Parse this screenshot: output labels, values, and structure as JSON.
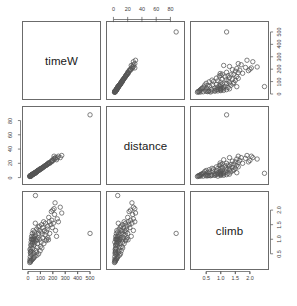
{
  "chart_data": {
    "type": "scatter",
    "title": "",
    "subtitle": "",
    "plot_kind": "scatterplot-matrix",
    "variables": [
      "timeW",
      "distance",
      "climb"
    ],
    "variable_labels": {
      "timeW": "timeW",
      "distance": "distance",
      "climb": "climb"
    },
    "axes": {
      "timeW": {
        "label": "timeW",
        "lim": [
          0,
          540
        ],
        "ticks": [
          0,
          100,
          200,
          300,
          400,
          500
        ],
        "tick_labels": [
          "0",
          "100",
          "200",
          "300",
          "400",
          "500"
        ]
      },
      "distance": {
        "label": "distance",
        "lim": [
          -2,
          92
        ],
        "ticks": [
          0,
          20,
          40,
          60,
          80
        ],
        "tick_labels": [
          "0",
          "20",
          "40",
          "60",
          "80"
        ]
      },
      "climb": {
        "label": "climb",
        "lim": [
          0.15,
          2.45
        ],
        "ticks": [
          0.5,
          1.0,
          1.5,
          2.0
        ],
        "tick_labels": [
          "0.5",
          "1.0",
          "1.5",
          "2.0"
        ]
      }
    },
    "grid": false,
    "legend": "none",
    "point_style": {
      "marker": "open-circle",
      "color": "#555555",
      "size": 2.2
    },
    "points": [
      {
        "timeW": 16.1,
        "distance": 2.5,
        "climb": 0.65
      },
      {
        "timeW": 60.0,
        "distance": 6.0,
        "climb": 2.5
      },
      {
        "timeW": 25.0,
        "distance": 2.0,
        "climb": 0.9
      },
      {
        "timeW": 22.0,
        "distance": 3.0,
        "climb": 0.8
      },
      {
        "timeW": 21.0,
        "distance": 3.0,
        "climb": 0.6
      },
      {
        "timeW": 29.0,
        "distance": 3.2,
        "climb": 1.1
      },
      {
        "timeW": 21.0,
        "distance": 2.4,
        "climb": 0.5
      },
      {
        "timeW": 18.0,
        "distance": 2.0,
        "climb": 0.4
      },
      {
        "timeW": 30.0,
        "distance": 4.0,
        "climb": 0.8
      },
      {
        "timeW": 27.0,
        "distance": 3.0,
        "climb": 1.0
      },
      {
        "timeW": 19.0,
        "distance": 2.5,
        "climb": 0.55
      },
      {
        "timeW": 32.0,
        "distance": 4.0,
        "climb": 1.0
      },
      {
        "timeW": 24.0,
        "distance": 3.0,
        "climb": 0.7
      },
      {
        "timeW": 36.0,
        "distance": 4.5,
        "climb": 1.0
      },
      {
        "timeW": 41.0,
        "distance": 5.0,
        "climb": 1.1
      },
      {
        "timeW": 34.0,
        "distance": 4.5,
        "climb": 0.85
      },
      {
        "timeW": 45.0,
        "distance": 5.5,
        "climb": 1.0
      },
      {
        "timeW": 38.0,
        "distance": 5.0,
        "climb": 0.9
      },
      {
        "timeW": 52.0,
        "distance": 6.0,
        "climb": 1.25
      },
      {
        "timeW": 49.0,
        "distance": 6.0,
        "climb": 1.05
      },
      {
        "timeW": 43.0,
        "distance": 5.5,
        "climb": 0.95
      },
      {
        "timeW": 55.0,
        "distance": 6.5,
        "climb": 1.1
      },
      {
        "timeW": 58.0,
        "distance": 7.0,
        "climb": 1.0
      },
      {
        "timeW": 62.0,
        "distance": 7.5,
        "climb": 1.15
      },
      {
        "timeW": 47.0,
        "distance": 6.0,
        "climb": 0.8
      },
      {
        "timeW": 66.0,
        "distance": 8.0,
        "climb": 0.95
      },
      {
        "timeW": 70.0,
        "distance": 8.0,
        "climb": 1.35
      },
      {
        "timeW": 74.0,
        "distance": 9.0,
        "climb": 1.0
      },
      {
        "timeW": 80.0,
        "distance": 10.0,
        "climb": 1.05
      },
      {
        "timeW": 85.0,
        "distance": 10.5,
        "climb": 1.2
      },
      {
        "timeW": 92.0,
        "distance": 11.0,
        "climb": 1.45
      },
      {
        "timeW": 78.0,
        "distance": 9.5,
        "climb": 0.85
      },
      {
        "timeW": 96.0,
        "distance": 12.0,
        "climb": 1.0
      },
      {
        "timeW": 104.0,
        "distance": 12.5,
        "climb": 1.25
      },
      {
        "timeW": 110.0,
        "distance": 13.0,
        "climb": 1.5
      },
      {
        "timeW": 100.0,
        "distance": 12.0,
        "climb": 0.75
      },
      {
        "timeW": 118.0,
        "distance": 14.0,
        "climb": 1.05
      },
      {
        "timeW": 126.0,
        "distance": 15.0,
        "climb": 1.6
      },
      {
        "timeW": 133.0,
        "distance": 16.0,
        "climb": 1.3
      },
      {
        "timeW": 141.0,
        "distance": 17.0,
        "climb": 1.55
      },
      {
        "timeW": 150.0,
        "distance": 18.0,
        "climb": 1.0
      },
      {
        "timeW": 158.0,
        "distance": 19.0,
        "climb": 1.45
      },
      {
        "timeW": 167.0,
        "distance": 20.0,
        "climb": 1.75
      },
      {
        "timeW": 175.0,
        "distance": 20.0,
        "climb": 1.2
      },
      {
        "timeW": 184.0,
        "distance": 22.0,
        "climb": 1.5
      },
      {
        "timeW": 192.0,
        "distance": 24.0,
        "climb": 1.65
      },
      {
        "timeW": 205.0,
        "distance": 26.0,
        "climb": 1.55
      },
      {
        "timeW": 214.0,
        "distance": 27.0,
        "climb": 1.85
      },
      {
        "timeW": 222.0,
        "distance": 28.0,
        "climb": 1.3
      },
      {
        "timeW": 200.0,
        "distance": 24.0,
        "climb": 2.0
      },
      {
        "timeW": 236.0,
        "distance": 28.0,
        "climb": 1.7
      },
      {
        "timeW": 245.0,
        "distance": 30.0,
        "climb": 1.6
      },
      {
        "timeW": 218.0,
        "distance": 26.0,
        "climb": 2.25
      },
      {
        "timeW": 500.0,
        "distance": 88.0,
        "climb": 1.2
      },
      {
        "timeW": 210.0,
        "distance": 30.0,
        "climb": 2.05
      },
      {
        "timeW": 188.0,
        "distance": 22.0,
        "climb": 1.95
      },
      {
        "timeW": 160.0,
        "distance": 19.0,
        "climb": 1.05
      },
      {
        "timeW": 145.0,
        "distance": 17.0,
        "climb": 0.95
      },
      {
        "timeW": 128.0,
        "distance": 15.0,
        "climb": 0.85
      },
      {
        "timeW": 112.0,
        "distance": 13.0,
        "climb": 0.7
      },
      {
        "timeW": 98.0,
        "distance": 11.0,
        "climb": 0.6
      },
      {
        "timeW": 86.0,
        "distance": 10.0,
        "climb": 0.5
      },
      {
        "timeW": 72.0,
        "distance": 8.5,
        "climb": 0.45
      },
      {
        "timeW": 68.0,
        "distance": 7.5,
        "climb": 0.55
      },
      {
        "timeW": 56.0,
        "distance": 6.5,
        "climb": 0.42
      },
      {
        "timeW": 50.0,
        "distance": 5.5,
        "climb": 0.38
      },
      {
        "timeW": 44.0,
        "distance": 5.0,
        "climb": 0.35
      },
      {
        "timeW": 39.0,
        "distance": 4.5,
        "climb": 0.33
      },
      {
        "timeW": 33.0,
        "distance": 3.8,
        "climb": 0.3
      },
      {
        "timeW": 28.0,
        "distance": 3.2,
        "climb": 0.28
      },
      {
        "timeW": 23.0,
        "distance": 2.8,
        "climb": 0.25
      },
      {
        "timeW": 20.0,
        "distance": 2.2,
        "climb": 0.22
      },
      {
        "timeW": 260.0,
        "distance": 28.0,
        "climb": 2.1
      },
      {
        "timeW": 272.0,
        "distance": 31.0,
        "climb": 1.9
      },
      {
        "timeW": 196.0,
        "distance": 23.0,
        "climb": 1.4
      },
      {
        "timeW": 172.0,
        "distance": 21.0,
        "climb": 1.6
      },
      {
        "timeW": 155.0,
        "distance": 18.5,
        "climb": 1.35
      },
      {
        "timeW": 138.0,
        "distance": 16.5,
        "climb": 1.15
      },
      {
        "timeW": 120.0,
        "distance": 14.5,
        "climb": 1.4
      },
      {
        "timeW": 106.0,
        "distance": 12.8,
        "climb": 0.9
      },
      {
        "timeW": 90.0,
        "distance": 10.8,
        "climb": 1.3
      },
      {
        "timeW": 76.0,
        "distance": 9.2,
        "climb": 0.72
      },
      {
        "timeW": 64.0,
        "distance": 7.8,
        "climb": 0.62
      },
      {
        "timeW": 54.0,
        "distance": 6.2,
        "climb": 0.88
      },
      {
        "timeW": 46.0,
        "distance": 5.2,
        "climb": 0.52
      },
      {
        "timeW": 37.0,
        "distance": 4.2,
        "climb": 0.68
      },
      {
        "timeW": 31.0,
        "distance": 3.6,
        "climb": 0.48
      },
      {
        "timeW": 26.0,
        "distance": 3.1,
        "climb": 0.58
      },
      {
        "timeW": 17.0,
        "distance": 2.1,
        "climb": 0.32
      },
      {
        "timeW": 15.0,
        "distance": 1.8,
        "climb": 0.26
      },
      {
        "timeW": 14.0,
        "distance": 1.5,
        "climb": 0.2
      },
      {
        "timeW": 230.0,
        "distance": 25.0,
        "climb": 1.1
      },
      {
        "timeW": 165.0,
        "distance": 20.5,
        "climb": 0.98
      },
      {
        "timeW": 148.0,
        "distance": 17.5,
        "climb": 1.25
      },
      {
        "timeW": 114.0,
        "distance": 13.5,
        "climb": 1.18
      },
      {
        "timeW": 82.0,
        "distance": 9.8,
        "climb": 1.42
      },
      {
        "timeW": 42.0,
        "distance": 4.8,
        "climb": 1.3
      },
      {
        "timeW": 35.0,
        "distance": 4.1,
        "climb": 1.2
      },
      {
        "timeW": 59.0,
        "distance": 6.8,
        "climb": 1.55
      }
    ],
    "panels": [
      {
        "row": 0,
        "col": 0,
        "kind": "diagonal",
        "label": "timeW"
      },
      {
        "row": 0,
        "col": 1,
        "kind": "scatter",
        "x": "distance",
        "y": "timeW"
      },
      {
        "row": 0,
        "col": 2,
        "kind": "scatter",
        "x": "climb",
        "y": "timeW"
      },
      {
        "row": 1,
        "col": 0,
        "kind": "scatter",
        "x": "timeW",
        "y": "distance"
      },
      {
        "row": 1,
        "col": 1,
        "kind": "diagonal",
        "label": "distance"
      },
      {
        "row": 1,
        "col": 2,
        "kind": "scatter",
        "x": "climb",
        "y": "distance"
      },
      {
        "row": 2,
        "col": 0,
        "kind": "scatter",
        "x": "timeW",
        "y": "climb"
      },
      {
        "row": 2,
        "col": 1,
        "kind": "scatter",
        "x": "distance",
        "y": "climb"
      },
      {
        "row": 2,
        "col": 2,
        "kind": "diagonal",
        "label": "climb"
      }
    ],
    "axis_placements": [
      {
        "side": "top",
        "col": 1,
        "variable": "distance"
      },
      {
        "side": "right",
        "row": 0,
        "variable": "timeW"
      },
      {
        "side": "left",
        "row": 1,
        "variable": "distance"
      },
      {
        "side": "bottom",
        "col": 0,
        "variable": "timeW"
      },
      {
        "side": "bottom",
        "col": 2,
        "variable": "climb"
      },
      {
        "side": "right",
        "row": 2,
        "variable": "climb"
      }
    ],
    "colors": {
      "background": "#ffffff",
      "panel_border": "#6b6b6b",
      "point": "#555555",
      "text": "#3d3d3d",
      "label": "#1a1a1a"
    }
  }
}
